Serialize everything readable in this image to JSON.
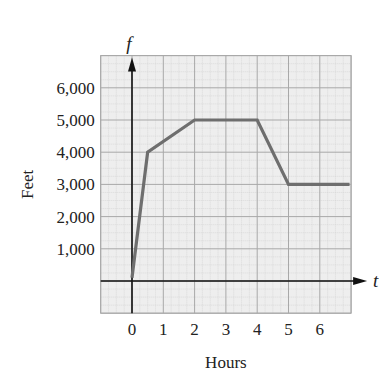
{
  "chart_data": {
    "type": "line",
    "title": "",
    "xlabel": "Hours",
    "ylabel": "Feet",
    "x_axis_variable": "t",
    "y_axis_variable": "f",
    "x_ticks": [
      "0",
      "1",
      "2",
      "3",
      "4",
      "5",
      "6"
    ],
    "y_ticks": [
      "1,000",
      "2,000",
      "3,000",
      "4,000",
      "5,000",
      "6,000"
    ],
    "xlim": [
      -1,
      7
    ],
    "ylim": [
      -1000,
      7000
    ],
    "grid": true,
    "legend": null,
    "series": [
      {
        "name": "f(t)",
        "color": "#6e6e6e",
        "x": [
          0,
          0.5,
          2,
          4,
          5,
          6.95
        ],
        "y": [
          100,
          4000,
          5000,
          5000,
          3000,
          3000
        ]
      }
    ]
  },
  "colors": {
    "grid_background": "#eeeeee",
    "grid_major": "#a8a8a8",
    "grid_minor": "#cfcfcf",
    "axis": "#111111",
    "line": "#6e6e6e"
  }
}
